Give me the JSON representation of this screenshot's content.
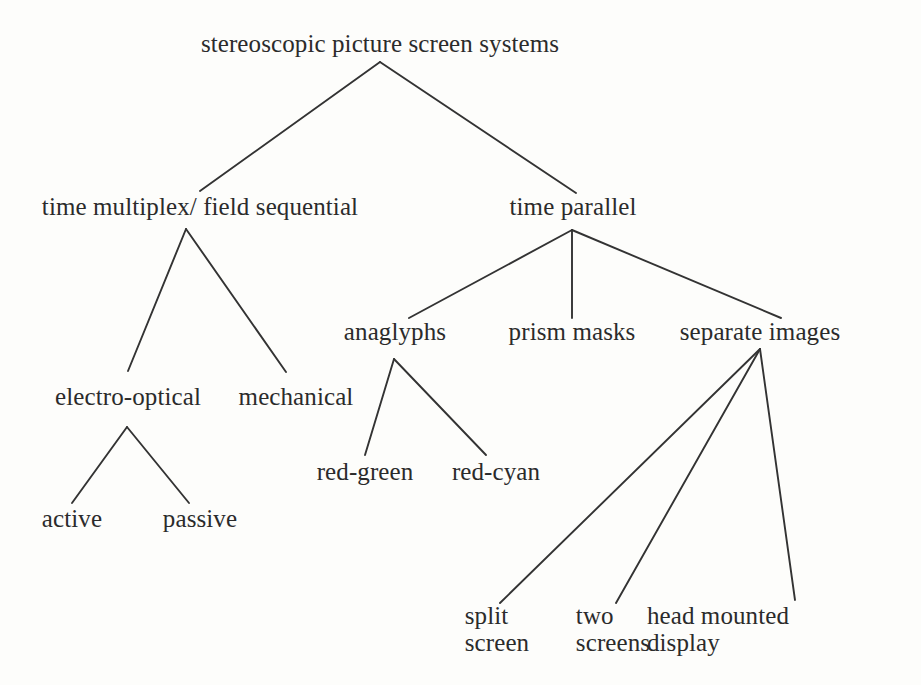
{
  "diagram": {
    "type": "tree-taxonomy",
    "title": "stereoscopic picture screen systems",
    "background_color": "#fdfdfb",
    "text_color": "#2b2b2b",
    "edge_color": "#333333",
    "nodes": [
      {
        "id": "root",
        "label": "stereoscopic picture screen systems",
        "x": 380,
        "y": 30,
        "level": 0
      },
      {
        "id": "time_multiplex",
        "label": "time multiplex/ field sequential",
        "x": 200,
        "y": 193,
        "level": 1
      },
      {
        "id": "time_parallel",
        "label": "time parallel",
        "x": 573,
        "y": 193,
        "level": 1
      },
      {
        "id": "electro_optical",
        "label": "electro-optical",
        "x": 128,
        "y": 383,
        "level": 2
      },
      {
        "id": "mechanical",
        "label": "mechanical",
        "x": 296,
        "y": 383,
        "level": 2
      },
      {
        "id": "anaglyphs",
        "label": "anaglyphs",
        "x": 395,
        "y": 318,
        "level": 2
      },
      {
        "id": "prism_masks",
        "label": "prism masks",
        "x": 572,
        "y": 318,
        "level": 2
      },
      {
        "id": "separate_images",
        "label": "separate images",
        "x": 760,
        "y": 318,
        "level": 2
      },
      {
        "id": "active",
        "label": "active",
        "x": 72,
        "y": 505,
        "level": 3
      },
      {
        "id": "passive",
        "label": "passive",
        "x": 200,
        "y": 505,
        "level": 3
      },
      {
        "id": "red_green",
        "label": "red-green",
        "x": 365,
        "y": 458,
        "level": 3
      },
      {
        "id": "red_cyan",
        "label": "red-cyan",
        "x": 496,
        "y": 458,
        "level": 3
      }
    ],
    "multiline_nodes": [
      {
        "id": "split_screen",
        "line1": "split",
        "line2": "screen",
        "x": 497,
        "y": 603,
        "level": 3
      },
      {
        "id": "two_screens",
        "line1": "two",
        "line2": "screens",
        "x": 613,
        "y": 603,
        "level": 3
      },
      {
        "id": "head_mounted",
        "line1": "head mounted",
        "line2": "display",
        "x": 718,
        "y": 603,
        "level": 3
      }
    ],
    "edges": [
      {
        "from": "root",
        "to": "time_multiplex",
        "x1": 380,
        "y1": 62,
        "x2": 200,
        "y2": 191
      },
      {
        "from": "root",
        "to": "time_parallel",
        "x1": 380,
        "y1": 62,
        "x2": 576,
        "y2": 193
      },
      {
        "from": "time_multiplex",
        "to": "electro_optical",
        "x1": 186,
        "y1": 229,
        "x2": 128,
        "y2": 371
      },
      {
        "from": "time_multiplex",
        "to": "mechanical",
        "x1": 186,
        "y1": 229,
        "x2": 286,
        "y2": 372
      },
      {
        "from": "time_parallel",
        "to": "anaglyphs",
        "x1": 572,
        "y1": 230,
        "x2": 409,
        "y2": 318
      },
      {
        "from": "time_parallel",
        "to": "prism_masks",
        "x1": 572,
        "y1": 230,
        "x2": 572,
        "y2": 318
      },
      {
        "from": "time_parallel",
        "to": "separate_images",
        "x1": 572,
        "y1": 230,
        "x2": 781,
        "y2": 318
      },
      {
        "from": "electro_optical",
        "to": "active",
        "x1": 127,
        "y1": 427,
        "x2": 72,
        "y2": 503
      },
      {
        "from": "electro_optical",
        "to": "passive",
        "x1": 127,
        "y1": 427,
        "x2": 189,
        "y2": 503
      },
      {
        "from": "anaglyphs",
        "to": "red_green",
        "x1": 394,
        "y1": 359,
        "x2": 365,
        "y2": 455
      },
      {
        "from": "anaglyphs",
        "to": "red_cyan",
        "x1": 394,
        "y1": 359,
        "x2": 486,
        "y2": 455
      },
      {
        "from": "separate_images",
        "to": "split_screen",
        "x1": 760,
        "y1": 349,
        "x2": 500,
        "y2": 603
      },
      {
        "from": "separate_images",
        "to": "two_screens",
        "x1": 760,
        "y1": 349,
        "x2": 616,
        "y2": 603
      },
      {
        "from": "separate_images",
        "to": "head_mounted",
        "x1": 760,
        "y1": 349,
        "x2": 795,
        "y2": 600
      }
    ]
  }
}
